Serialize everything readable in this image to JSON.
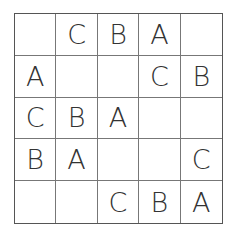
{
  "puzzle": {
    "rows": 5,
    "cols": 5,
    "cells": [
      [
        "",
        "C",
        "B",
        "A",
        ""
      ],
      [
        "A",
        "",
        "",
        "C",
        "B"
      ],
      [
        "C",
        "B",
        "A",
        "",
        ""
      ],
      [
        "B",
        "A",
        "",
        "",
        "C"
      ],
      [
        "",
        "",
        "C",
        "B",
        "A"
      ]
    ]
  }
}
